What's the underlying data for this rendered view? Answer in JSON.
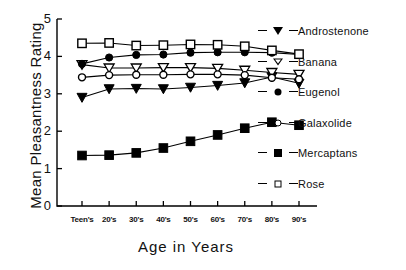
{
  "chart_data": {
    "type": "line",
    "title": "",
    "xlabel": "Age  in  Years",
    "ylabel": "Mean Pleasantness Rating",
    "categories": [
      "Teen's",
      "20's",
      "30's",
      "40's",
      "50's",
      "60's",
      "70's",
      "80's",
      "90's"
    ],
    "ylim": [
      0,
      5
    ],
    "yticks": [
      0,
      1,
      2,
      3,
      4,
      5
    ],
    "grid": false,
    "legend_position": "right",
    "series": [
      {
        "name": "Androstenone",
        "marker": "triangle-down-filled",
        "values": [
          2.9,
          3.13,
          3.14,
          3.13,
          3.17,
          3.22,
          3.29,
          3.45,
          3.28
        ]
      },
      {
        "name": "Banana",
        "marker": "triangle-down-open",
        "values": [
          3.78,
          3.69,
          3.69,
          3.7,
          3.7,
          3.68,
          3.63,
          3.57,
          3.52
        ]
      },
      {
        "name": "Eugenol",
        "marker": "circle-filled",
        "values": [
          3.8,
          3.97,
          4.04,
          4.05,
          4.1,
          4.11,
          4.11,
          4.1,
          4.05
        ]
      },
      {
        "name": "Galaxolide",
        "marker": "circle-open",
        "values": [
          3.44,
          3.5,
          3.51,
          3.51,
          3.52,
          3.52,
          3.5,
          3.43,
          3.39
        ]
      },
      {
        "name": "Mercaptans",
        "marker": "square-filled",
        "values": [
          1.35,
          1.36,
          1.42,
          1.55,
          1.73,
          1.9,
          2.08,
          2.24,
          2.16
        ]
      },
      {
        "name": "Rose",
        "marker": "square-open",
        "values": [
          4.35,
          4.36,
          4.29,
          4.3,
          4.32,
          4.31,
          4.27,
          4.16,
          4.06
        ]
      }
    ]
  },
  "legend": {
    "items": [
      {
        "label": "Androstenone",
        "marker": "triangle-down-filled"
      },
      {
        "label": "Banana",
        "marker": "triangle-down-open"
      },
      {
        "label": "Eugenol",
        "marker": "circle-filled"
      },
      {
        "label": "Galaxolide",
        "marker": "circle-open"
      },
      {
        "label": "Mercaptans",
        "marker": "square-filled"
      },
      {
        "label": "Rose",
        "marker": "square-open"
      }
    ]
  },
  "colors": {
    "ink": "#000000",
    "background": "#ffffff"
  }
}
